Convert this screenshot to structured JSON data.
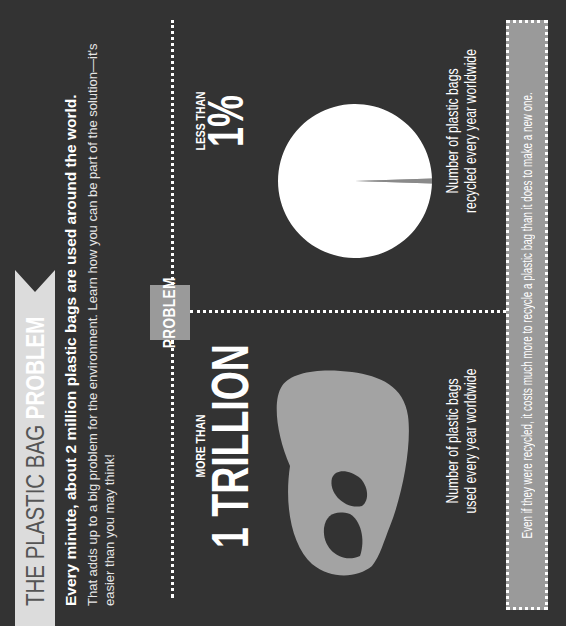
{
  "header": {
    "title_prefix": "THE PLASTIC BAG ",
    "title_accent": "PROBLEM",
    "banner_color": "#dcdcdc"
  },
  "intro": {
    "headline": "Every minute, about 2 million plastic bags are used around the world.",
    "body": "That adds up to a big problem for the environment. Learn how you can be part of the solution—it's easier than you may think!"
  },
  "section": {
    "label": "PROBLEM",
    "label_bg": "#9a9a9a"
  },
  "used": {
    "qualifier": "MORE THAN",
    "value": "1 TRILLION",
    "caption_line1": "Number of plastic bags",
    "caption_line2": "used every year worldwide",
    "icon": "plastic-bag-icon",
    "icon_color": "#a3a3a3"
  },
  "recycled": {
    "qualifier": "LESS THAN",
    "value": "1%",
    "caption_line1": "Number of plastic bags",
    "caption_line2": "recycled every year worldwide"
  },
  "chart_data": {
    "type": "pie",
    "slices": [
      {
        "label": "Recycled",
        "value": 1,
        "color": "#8a8a8a"
      },
      {
        "label": "Not recycled",
        "value": 99,
        "color": "#ffffff"
      }
    ],
    "annotation": "LESS THAN 1%"
  },
  "footer": {
    "note": "Even if they were recycled, it costs much more to recycle a plastic bag than it does to make a new one."
  },
  "colors": {
    "background": "#333333",
    "text": "#ffffff",
    "muted_box": "#9a9a9a"
  }
}
